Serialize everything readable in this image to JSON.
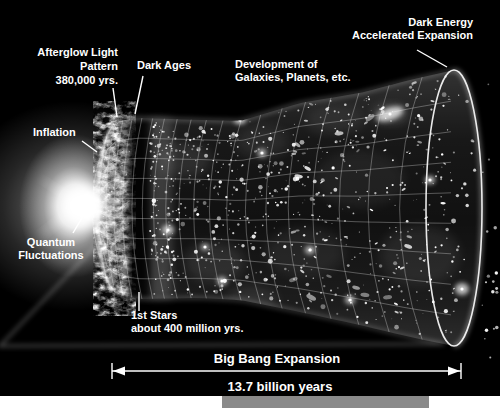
{
  "labels": {
    "afterglow": {
      "line1": "Afterglow Light",
      "line2": "Pattern",
      "line3": "380,000 yrs."
    },
    "dark_ages": {
      "text": "Dark Ages"
    },
    "development": {
      "line1": "Development of",
      "line2": "Galaxies, Planets, etc."
    },
    "dark_energy": {
      "line1": "Dark Energy",
      "line2": "Accelerated Expansion"
    },
    "inflation": {
      "text": "Inflation"
    },
    "quantum": {
      "line1": "Quantum",
      "line2": "Fluctuations"
    },
    "first_stars": {
      "line1": "1st Stars",
      "line2": "about 400 million yrs."
    },
    "big_bang": {
      "text": "Big Bang Expansion"
    },
    "duration": {
      "text": "13.7 billion years"
    }
  },
  "colors": {
    "background": "#000000",
    "text": "#ffffff",
    "grid_line": "rgba(255,255,255,0.42)",
    "rim_line": "rgba(255,255,255,0.9)",
    "cmb_base": "#7a7a7a",
    "strip_white": "#ffffff",
    "strip_gray": "#8a8a8a"
  },
  "diagram": {
    "type": "universe-expansion-funnel",
    "star_seed": 1337,
    "star_count": 720,
    "outside_star_count": 18,
    "timeline_arrow": {
      "x1": 112,
      "x2": 461,
      "y": 371
    }
  }
}
